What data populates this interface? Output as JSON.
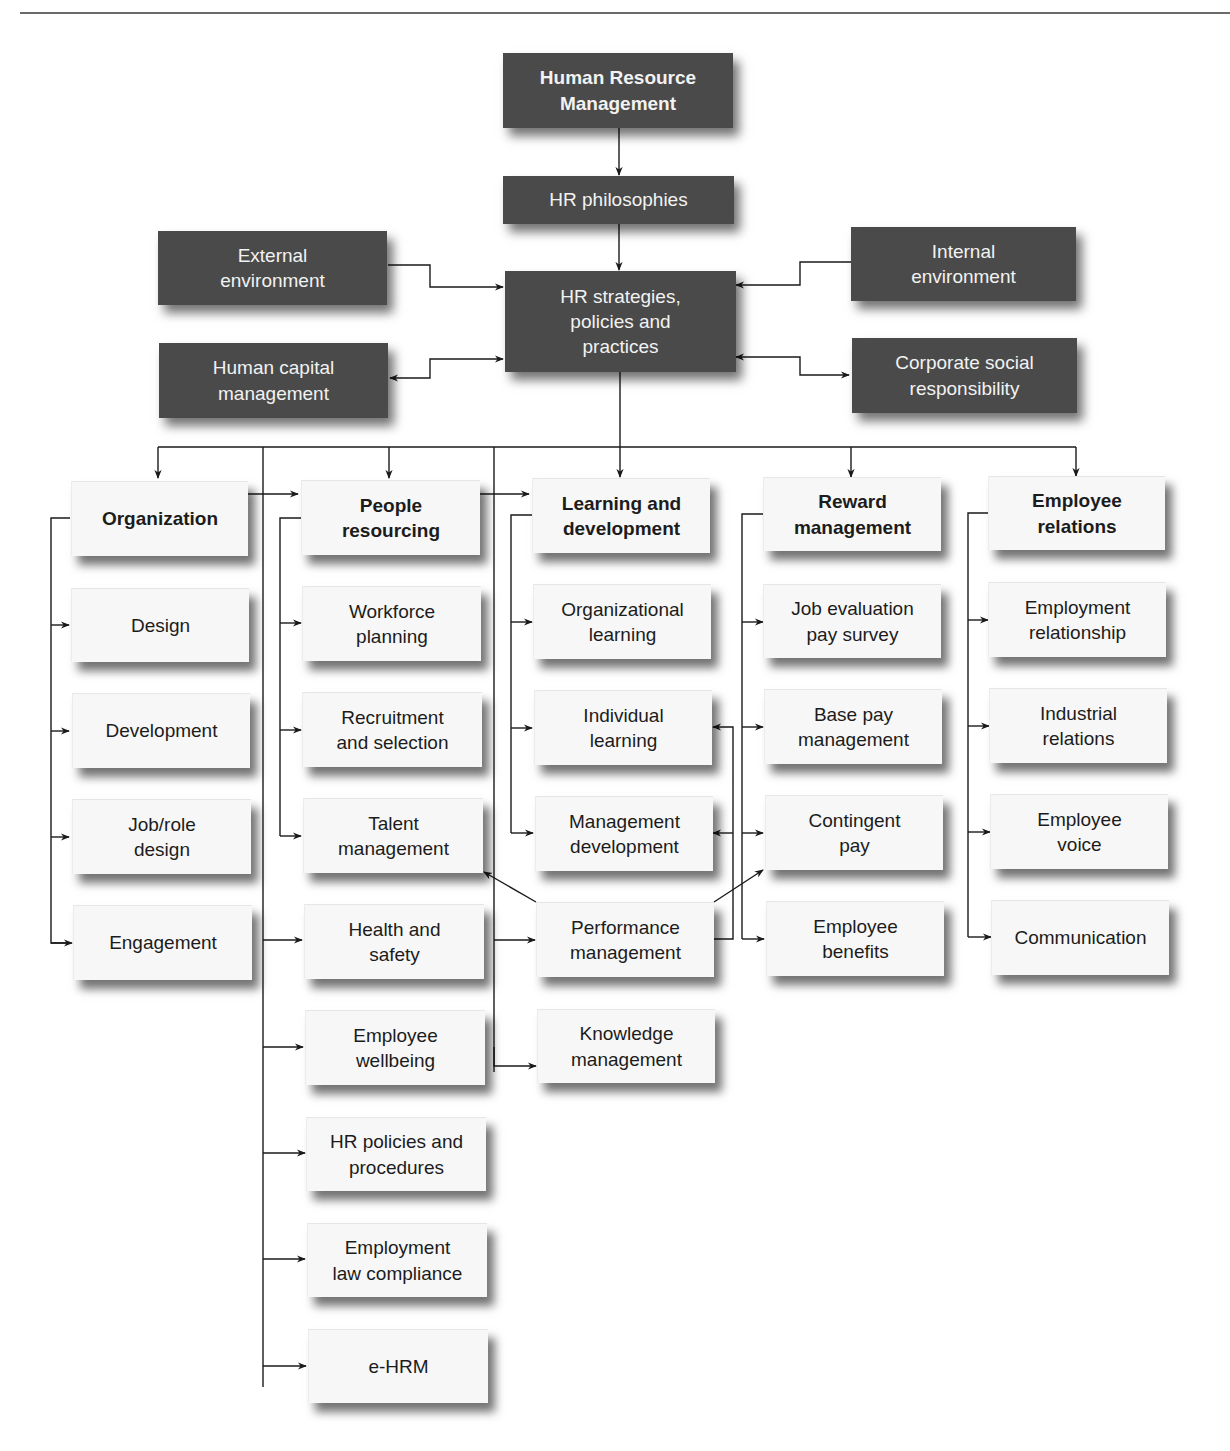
{
  "diagram": {
    "root": {
      "label": "Human Resource\nManagement"
    },
    "philosophies": {
      "label": "HR philosophies"
    },
    "strategies": {
      "label": "HR strategies,\npolicies and\npractices"
    },
    "context": {
      "external_environment": "External\nenvironment",
      "internal_environment": "Internal\nenvironment",
      "human_capital_management": "Human capital\nmanagement",
      "corporate_social_responsibility": "Corporate social\nresponsibility"
    },
    "columns": [
      {
        "heading": "Organization",
        "items": [
          "Design",
          "Development",
          "Job/role\ndesign",
          "Engagement"
        ]
      },
      {
        "heading": "People\nresourcing",
        "items": [
          "Workforce\nplanning",
          "Recruitment\nand selection",
          "Talent\nmanagement",
          "Health and\nsafety",
          "Employee\nwellbeing",
          "HR policies and\nprocedures",
          "Employment\nlaw compliance",
          "e-HRM"
        ]
      },
      {
        "heading": "Learning and\ndevelopment",
        "items": [
          "Organizational\nlearning",
          "Individual\nlearning",
          "Management\ndevelopment",
          "Performance\nmanagement",
          "Knowledge\nmanagement"
        ]
      },
      {
        "heading": "Reward\nmanagement",
        "items": [
          "Job evaluation\npay survey",
          "Base pay\nmanagement",
          "Contingent\npay",
          "Employee\nbenefits"
        ]
      },
      {
        "heading": "Employee\nrelations",
        "items": [
          "Employment\nrelationship",
          "Industrial\nrelations",
          "Employee\nvoice",
          "Communication"
        ]
      }
    ],
    "colors": {
      "dark_box": "#4a4a4a",
      "dark_text": "#f2f2f2",
      "light_box": "#f7f7f7",
      "light_text": "#1c1c1c",
      "connector": "#1a1a1a"
    }
  }
}
